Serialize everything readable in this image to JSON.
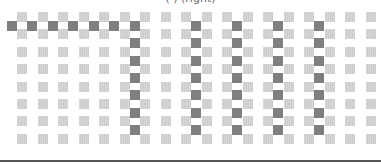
{
  "caption": "(                    )        (right)",
  "grid": {
    "columns": 18,
    "rows": 8,
    "col_start_x": 22,
    "col_spacing": 20.5,
    "row_start_y": 17,
    "row_spacing": 17.4,
    "cell_size": 10
  },
  "colors": {
    "light_cell": "#cdcdcd",
    "dark_cell": "#7f7f7f",
    "baseline": "#555555"
  },
  "paths": {
    "horizontal": {
      "gap_row": 0,
      "from_mid_col": -1,
      "to_mid_col": 5
    },
    "vertical": [
      {
        "mid_col": 5,
        "from_gap_row": 0,
        "to_gap_row": 6
      },
      {
        "mid_col": 8,
        "from_gap_row": 0,
        "to_gap_row": 6
      },
      {
        "mid_col": 10,
        "from_gap_row": 0,
        "to_gap_row": 6
      },
      {
        "mid_col": 12,
        "from_gap_row": 0,
        "to_gap_row": 6
      },
      {
        "mid_col": 14,
        "from_gap_row": 0,
        "to_gap_row": 6
      }
    ]
  }
}
